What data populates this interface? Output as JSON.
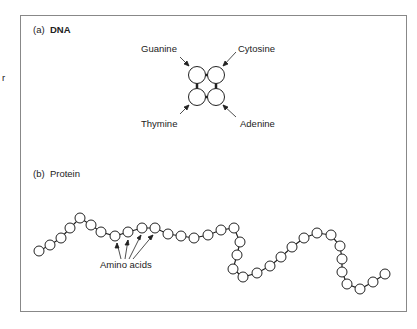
{
  "edge_fragment": "r",
  "panel_a": {
    "label_prefix": "(a)",
    "title": "DNA",
    "bases": [
      {
        "name": "Guanine",
        "position": "top-left"
      },
      {
        "name": "Cytosine",
        "position": "top-right"
      },
      {
        "name": "Thymine",
        "position": "bottom-left"
      },
      {
        "name": "Adenine",
        "position": "bottom-right"
      }
    ]
  },
  "panel_b": {
    "label_prefix": "(b)",
    "title": "Protein",
    "annotation": "Amino acids",
    "bead_count": 36
  }
}
